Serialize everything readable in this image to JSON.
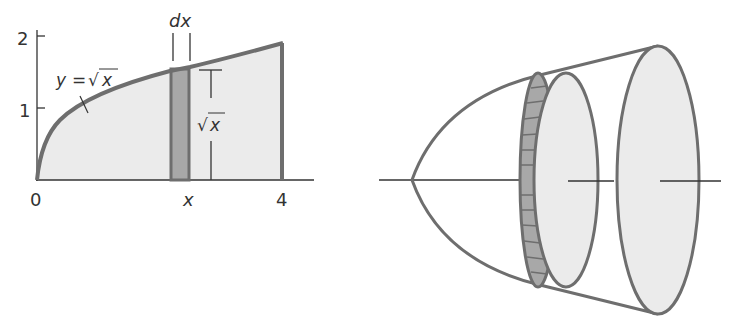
{
  "figure": {
    "left_panel": {
      "description": "Region under y = sqrt(x) from 0 to 4 with a vertical strip of width dx",
      "y_ticks": [
        "1",
        "2"
      ],
      "x_ticks": [
        "0",
        "x",
        "4"
      ],
      "curve_label": "y = √x",
      "curve_label_parts": {
        "y": "y",
        "eq": "=",
        "root": "√",
        "x": "x"
      },
      "strip_width_label": "dx",
      "strip_height_label": "√x",
      "strip_height_parts": {
        "root": "√",
        "x": "x"
      }
    },
    "right_panel": {
      "description": "Solid of revolution (paraboloid) with a disk slice of thickness dx"
    },
    "colors": {
      "outline": "#6e6e6e",
      "fill_light": "#ebebeb",
      "strip_fill": "#a8a8a8",
      "axis": "#333333",
      "text": "#333333"
    }
  }
}
